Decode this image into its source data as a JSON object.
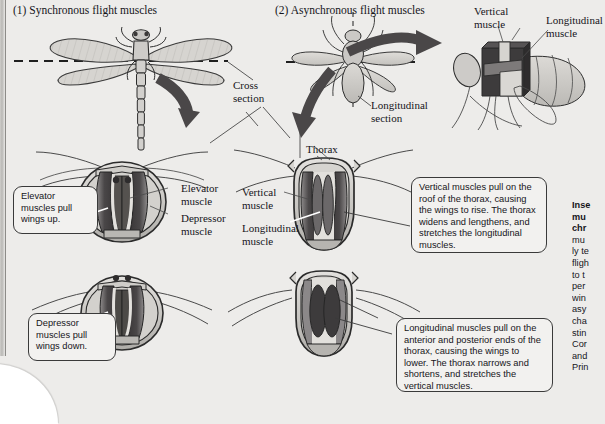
{
  "figure": {
    "background_color": "#edecea",
    "panels": [
      {
        "id": "p1",
        "label": "(1)  Synchronous flight muscles"
      },
      {
        "id": "p2",
        "label": "(2)  Asynchronous flight muscles"
      }
    ]
  },
  "labels": {
    "cross_section_l1": "Cross",
    "cross_section_l2": "section",
    "longitudinal_section_l1": "Longitudinal",
    "longitudinal_section_l2": "section",
    "vertical_muscle_top_l1": "Vertical",
    "vertical_muscle_top_l2": "muscle",
    "longitudinal_muscle_top_l1": "Longitudinal",
    "longitudinal_muscle_top_l2": "muscle",
    "elevator_muscle_l1": "Elevator",
    "elevator_muscle_l2": "muscle",
    "depressor_muscle_l1": "Depressor",
    "depressor_muscle_l2": "muscle",
    "vertical_muscle_mid_l1": "Vertical",
    "vertical_muscle_mid_l2": "muscle",
    "longitudinal_muscle_mid_l1": "Longitudinal",
    "longitudinal_muscle_mid_l2": "muscle",
    "thorax": "Thorax"
  },
  "callouts": {
    "elevator": "Elevator muscles pull wings up.",
    "depressor": "Depressor muscles pull wings down.",
    "vertical": "Vertical muscles pull on the roof of the thorax, causing the wings to rise. The thorax widens and lengthens, and stretches the longitudinal muscles.",
    "longitudinal": "Longitudinal muscles pull on the anterior and posterior ends of the thorax, causing the wings to lower. The thorax narrows and shortens, and stretches the vertical muscles."
  },
  "side_column": {
    "heading_line1": "Inse",
    "heading_line2": "mu",
    "heading_line3": "chr",
    "body_lines": [
      "mu",
      "ly te",
      "fligh",
      "to t",
      "per",
      "win",
      "asy",
      "cha",
      "stin",
      "Cor",
      "and",
      "Prin"
    ]
  },
  "colors": {
    "page": "#edecea",
    "muscle_dark": "#3d3b3c",
    "muscle_mid": "#6d6a6b",
    "body_light": "#c9c7c4",
    "wing_fill": "#d4d2cf",
    "outline": "#2a2a2a",
    "arrow": "#4a4748",
    "callout_bg": "#f2f1ef"
  }
}
